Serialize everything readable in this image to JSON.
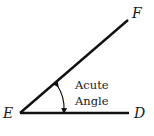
{
  "diagram": {
    "type": "angle",
    "vertices": {
      "E": {
        "label": "E"
      },
      "F": {
        "label": "F"
      },
      "D": {
        "label": "D"
      }
    },
    "annotation": {
      "line1": "Acute",
      "line2": "Angle"
    },
    "colors": {
      "stroke": "#111111",
      "background": "#ffffff"
    }
  }
}
